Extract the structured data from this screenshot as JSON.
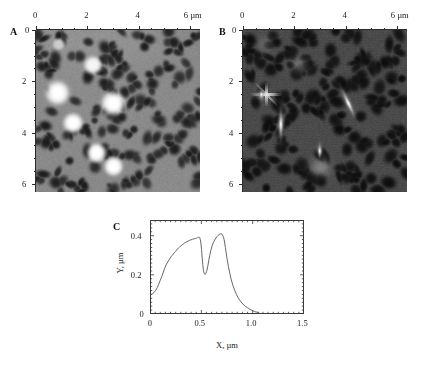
{
  "figure": {
    "background_color": "#ffffff",
    "panels": [
      "A",
      "B",
      "C"
    ]
  },
  "panel_a": {
    "letter": "A",
    "origin_label": "0",
    "top_axis": {
      "tick_labels": [
        "0",
        "2",
        "4",
        "6"
      ],
      "unit": "µm",
      "range": [
        0,
        6.4
      ]
    },
    "left_axis": {
      "tick_labels": [
        "0",
        "2",
        "4",
        "6"
      ],
      "range": [
        0,
        6.4
      ]
    },
    "image_kind": "afm-topography",
    "background_gray": "#8a8a8a",
    "particle_color": "#ffffff",
    "pit_color": "#1b1b1b"
  },
  "panel_b": {
    "letter": "B",
    "origin_label": "0",
    "top_axis": {
      "tick_labels": [
        "0",
        "2",
        "4",
        "6"
      ],
      "unit": "µm",
      "range": [
        0,
        6.4
      ]
    },
    "left_axis": {
      "tick_labels": [
        "0",
        "2",
        "4",
        "6"
      ],
      "range": [
        0,
        6.4
      ]
    },
    "image_kind": "afm-phase",
    "background_gray": "#4a4a4a",
    "particle_color": "#fdfdfd",
    "pit_color": "#0d0d0d"
  },
  "panel_c": {
    "letter": "C",
    "line_color": "#555555"
  },
  "chart_data": {
    "type": "line",
    "title": "",
    "xlabel": "X, µm",
    "ylabel": "Y, µm",
    "xlim": [
      0,
      1.5
    ],
    "ylim": [
      0,
      0.48
    ],
    "xticks": [
      0,
      0.5,
      1.0,
      1.5
    ],
    "xtick_labels": [
      "0",
      "0.5",
      "1.0",
      "1.5"
    ],
    "yticks": [
      0,
      0.2,
      0.4
    ],
    "ytick_labels": [
      "0",
      "0.2",
      "0.4"
    ],
    "x_minor_tick_step": 0.05,
    "y_minor_tick_step": 0.02,
    "grid": false,
    "legend": null,
    "series": [
      {
        "name": "height profile",
        "x": [
          0.0,
          0.012,
          0.025,
          0.04,
          0.055,
          0.07,
          0.085,
          0.1,
          0.115,
          0.13,
          0.145,
          0.16,
          0.175,
          0.19,
          0.205,
          0.22,
          0.235,
          0.25,
          0.265,
          0.28,
          0.295,
          0.31,
          0.325,
          0.34,
          0.355,
          0.37,
          0.385,
          0.4,
          0.415,
          0.43,
          0.445,
          0.455,
          0.465,
          0.472,
          0.478,
          0.484,
          0.49,
          0.496,
          0.502,
          0.508,
          0.514,
          0.52,
          0.527,
          0.535,
          0.543,
          0.552,
          0.562,
          0.572,
          0.582,
          0.594,
          0.606,
          0.618,
          0.63,
          0.642,
          0.654,
          0.664,
          0.674,
          0.684,
          0.692,
          0.7,
          0.708,
          0.716,
          0.722,
          0.728,
          0.734,
          0.742,
          0.752,
          0.764,
          0.778,
          0.792,
          0.808,
          0.824,
          0.842,
          0.86,
          0.878,
          0.896,
          0.914,
          0.932,
          0.95,
          0.968,
          0.986,
          1.004,
          1.02,
          1.035
        ],
        "y": [
          0.098,
          0.1,
          0.104,
          0.11,
          0.12,
          0.134,
          0.152,
          0.172,
          0.192,
          0.214,
          0.236,
          0.254,
          0.268,
          0.28,
          0.292,
          0.302,
          0.312,
          0.32,
          0.33,
          0.338,
          0.346,
          0.352,
          0.358,
          0.364,
          0.368,
          0.372,
          0.376,
          0.379,
          0.382,
          0.384,
          0.386,
          0.388,
          0.39,
          0.392,
          0.393,
          0.39,
          0.38,
          0.362,
          0.33,
          0.29,
          0.252,
          0.224,
          0.208,
          0.202,
          0.206,
          0.218,
          0.242,
          0.272,
          0.3,
          0.328,
          0.35,
          0.366,
          0.378,
          0.388,
          0.396,
          0.402,
          0.406,
          0.409,
          0.41,
          0.408,
          0.402,
          0.392,
          0.38,
          0.362,
          0.34,
          0.312,
          0.278,
          0.242,
          0.206,
          0.174,
          0.146,
          0.122,
          0.1,
          0.082,
          0.068,
          0.056,
          0.046,
          0.038,
          0.032,
          0.026,
          0.021,
          0.016,
          0.012,
          0.01
        ]
      }
    ],
    "annotations": [
      {
        "text": "peak 1",
        "x": 0.478,
        "y": 0.393
      },
      {
        "text": "valley",
        "x": 0.535,
        "y": 0.202
      },
      {
        "text": "peak 2",
        "x": 0.692,
        "y": 0.41
      }
    ]
  }
}
